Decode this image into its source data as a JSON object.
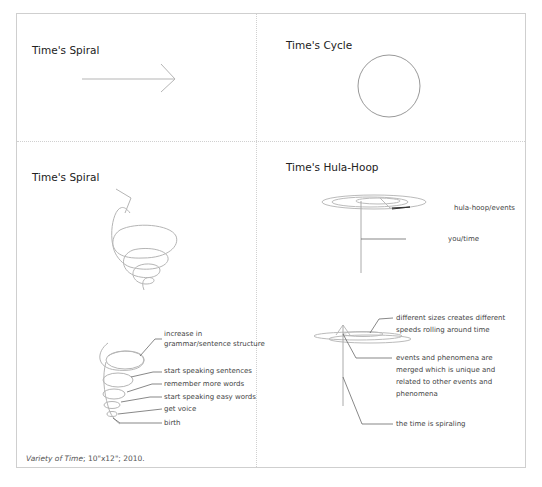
{
  "panels": {
    "top_left": {
      "title": "Time's Spiral",
      "figure": "arrow-right"
    },
    "top_right": {
      "title": "Time's Cycle",
      "figure": "circle"
    },
    "bottom_left": {
      "title": "Time's Spiral",
      "figure": "spiral",
      "labels": [
        "increase in",
        "grammar/sentence structure",
        "start speaking sentences",
        "remember more words",
        "start speaking easy words",
        "get voice",
        "birth"
      ]
    },
    "bottom_right": {
      "title": "Time's Hula-Hoop",
      "figure": "hula-hoop",
      "labels": {
        "hoop": "hula-hoop/events",
        "axis": "you/time",
        "sizes_line1": "different sizes creates different",
        "sizes_line2": "speeds rolling around time",
        "merged_line1": "events and phenomena are",
        "merged_line2": "merged which is unique and",
        "merged_line3": "related to other events and",
        "merged_line4": "phenomena",
        "spiraling": "the time is spiraling"
      }
    }
  },
  "caption": {
    "title": "Variety of Time",
    "details": "; 10\"x12\"; 2010."
  },
  "colors": {
    "line": "#b5b5b5",
    "leader": "#555555",
    "frame": "#cfcfcf"
  }
}
